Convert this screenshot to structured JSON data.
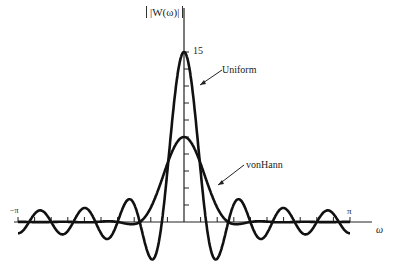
{
  "chart_data": {
    "type": "line",
    "title": "",
    "xlabel": "ω",
    "ylabel": "|W(ω)|",
    "x_ticks": [
      "-π",
      "π"
    ],
    "y_tick_label": "15",
    "xlim": [
      -3.1416,
      3.1416
    ],
    "ylim": [
      -3,
      17
    ],
    "series": [
      {
        "name": "Uniform",
        "description": "Dirichlet kernel, N=15",
        "peak": 15
      },
      {
        "name": "vonHann",
        "description": "Hann window spectrum",
        "peak": 7.5
      }
    ],
    "annotations": [
      "Uniform",
      "vonHann"
    ]
  },
  "labels": {
    "ylabel": "|W(ω)|",
    "y15": "15",
    "uniform": "Uniform",
    "vonhann": "vonHann",
    "neg_pi": "−π",
    "pos_pi": "π",
    "omega": "ω"
  }
}
